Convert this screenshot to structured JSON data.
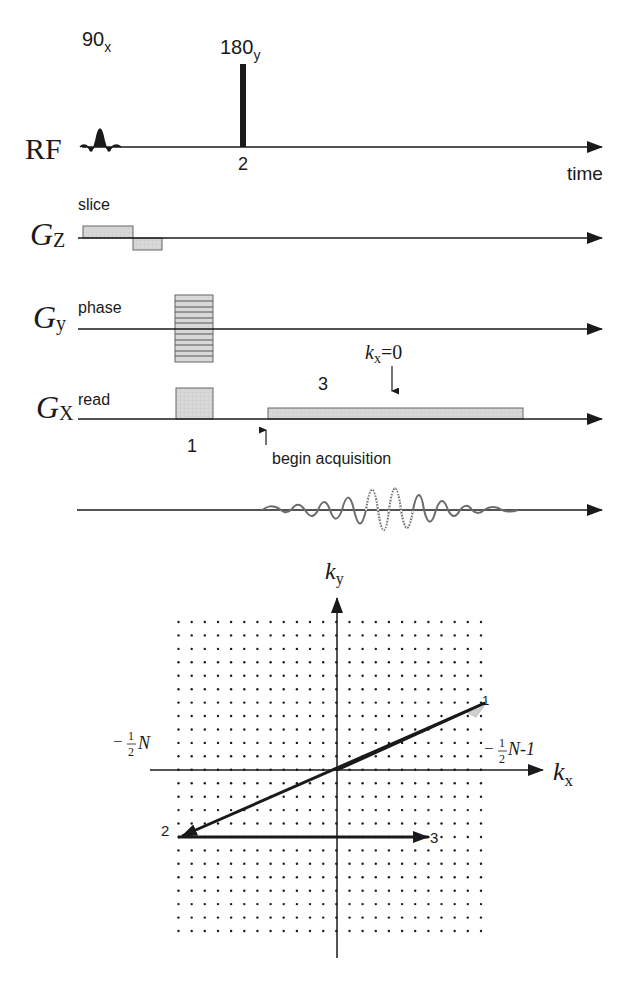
{
  "pulse_sequence": {
    "rf": {
      "label": "RF",
      "pulse_90_label": "90",
      "pulse_90_sub": "x",
      "pulse_180_label": "180",
      "pulse_180_sub": "y",
      "event_label_2": "2",
      "time_axis_label": "time"
    },
    "gz": {
      "label_main": "G",
      "label_sub": "Z",
      "role": "slice"
    },
    "gy": {
      "label_main": "G",
      "label_sub": "y",
      "role": "phase"
    },
    "gx": {
      "label_main": "G",
      "label_sub": "X",
      "role": "read",
      "event_label_1": "1",
      "event_label_3": "3",
      "kx_zero_main": "k",
      "kx_zero_sub": "x",
      "kx_zero_eq": "=0",
      "begin_acquisition": "begin acquisition"
    },
    "signal": {
      "description": "echo signal"
    }
  },
  "kspace": {
    "ky_main": "k",
    "ky_sub": "y",
    "kx_main": "k",
    "kx_sub": "x",
    "left_label_sign": "−",
    "left_label_num": "1",
    "left_label_den": "2",
    "left_label_var": "N",
    "right_label_sign": "−",
    "right_label_num": "1",
    "right_label_den": "2",
    "right_label_var": "N-1",
    "point_1": "1",
    "point_2": "2",
    "point_3": "3",
    "grid_columns": 24,
    "grid_rows": 24
  },
  "colors": {
    "line": "#1a1a1a",
    "gradient_fill": "#d4d4d4",
    "gradient_stroke": "#555555",
    "dot": "#1a1a1a"
  }
}
